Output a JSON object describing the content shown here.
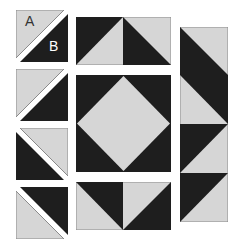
{
  "colors": {
    "dark": "#1e1e1e",
    "light": "#d6d6d6",
    "outline": "#8a8a8a",
    "background": "#ffffff"
  },
  "labels": {
    "a": "A",
    "b": "B"
  },
  "diagram": {
    "left_column": [
      "half-square triangle A/B separated",
      "half-square triangle",
      "half-square triangle",
      "half-square triangle"
    ],
    "center": [
      "flying geese pair top",
      "square-in-square center",
      "flying geese pair bottom"
    ],
    "right_column": [
      "strip of 4 half-square triangles"
    ]
  }
}
